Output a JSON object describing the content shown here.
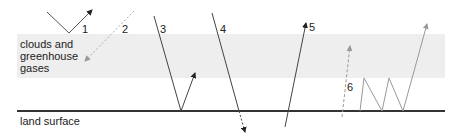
{
  "diagram": {
    "layers": {
      "atmosphere_label": "clouds and\ngreenhouse\ngases",
      "surface_label": "land surface"
    },
    "paths": [
      {
        "id": "1",
        "label": "1",
        "description": "reflected by clouds back to space",
        "style": "solid"
      },
      {
        "id": "2",
        "label": "2",
        "description": "emitted downward from clouds/greenhouse gases",
        "style": "dashed-gray"
      },
      {
        "id": "3",
        "label": "3",
        "description": "reflected by land surface",
        "style": "solid"
      },
      {
        "id": "4",
        "label": "4",
        "description": "absorbed into land surface",
        "style": "solid"
      },
      {
        "id": "5",
        "label": "5",
        "description": "passes upward through atmosphere",
        "style": "solid"
      },
      {
        "id": "6",
        "label": "6",
        "description": "emitted from surface, trapped and re-radiated",
        "style": "gray"
      }
    ],
    "colors": {
      "band": "#eeeeee",
      "surface": "#333333",
      "solid_arrow": "#222222",
      "gray_arrow": "#999999"
    }
  }
}
